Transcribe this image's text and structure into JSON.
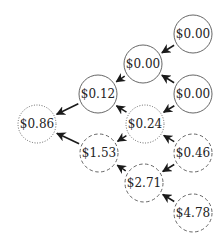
{
  "diagram": {
    "type": "lattice-tree",
    "stroke_color": "#555555",
    "arrow_color": "#1a1a1a",
    "node_radius": 19,
    "nodes": [
      {
        "id": "n1",
        "label": "$0.00",
        "x": 193,
        "y": 34,
        "style": "solid"
      },
      {
        "id": "n2",
        "label": "$0.00",
        "x": 143,
        "y": 64,
        "style": "solid"
      },
      {
        "id": "n3",
        "label": "$0.12",
        "x": 98,
        "y": 94,
        "style": "solid"
      },
      {
        "id": "n4",
        "label": "$0.00",
        "x": 193,
        "y": 94,
        "style": "solid"
      },
      {
        "id": "n5",
        "label": "$0.86",
        "x": 37,
        "y": 124,
        "style": "dotted"
      },
      {
        "id": "n6",
        "label": "$0.24",
        "x": 145,
        "y": 124,
        "style": "dotted"
      },
      {
        "id": "n7",
        "label": "$1.53",
        "x": 99,
        "y": 153,
        "style": "dashed"
      },
      {
        "id": "n8",
        "label": "$0.46",
        "x": 193,
        "y": 153,
        "style": "dashed"
      },
      {
        "id": "n9",
        "label": "$2.71",
        "x": 144,
        "y": 183,
        "style": "dashed"
      },
      {
        "id": "n10",
        "label": "$4.78",
        "x": 193,
        "y": 213,
        "style": "dashed"
      }
    ],
    "edges": [
      {
        "from": "n1",
        "to": "n2"
      },
      {
        "from": "n2",
        "to": "n3"
      },
      {
        "from": "n4",
        "to": "n2"
      },
      {
        "from": "n4",
        "to": "n6"
      },
      {
        "from": "n3",
        "to": "n5"
      },
      {
        "from": "n6",
        "to": "n3"
      },
      {
        "from": "n6",
        "to": "n7"
      },
      {
        "from": "n7",
        "to": "n5"
      },
      {
        "from": "n8",
        "to": "n6"
      },
      {
        "from": "n8",
        "to": "n9"
      },
      {
        "from": "n9",
        "to": "n7"
      },
      {
        "from": "n10",
        "to": "n9"
      }
    ]
  }
}
